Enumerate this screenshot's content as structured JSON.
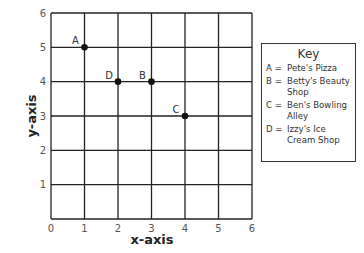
{
  "chart_data": {
    "type": "scatter",
    "title": "",
    "xlabel": "x-axis",
    "ylabel": "y-axis",
    "xlim": [
      0,
      6
    ],
    "ylim": [
      0,
      6
    ],
    "grid": true,
    "x_ticks": [
      "0",
      "1",
      "2",
      "3",
      "4",
      "5",
      "6"
    ],
    "y_ticks": [
      "0",
      "1",
      "2",
      "3",
      "4",
      "5",
      "6"
    ],
    "points": [
      {
        "label": "A",
        "x": 1,
        "y": 5,
        "name": "Pete's Pizza"
      },
      {
        "label": "B",
        "x": 3,
        "y": 4,
        "name": "Betty's Beauty Shop"
      },
      {
        "label": "C",
        "x": 4,
        "y": 3,
        "name": "Ben's Bowling Alley"
      },
      {
        "label": "D",
        "x": 2,
        "y": 4,
        "name": "Izzy's Ice Cream Shop"
      }
    ],
    "legend": {
      "title": "Key",
      "position": "right",
      "entries": [
        {
          "letter": "A =",
          "name": "Pete's Pizza"
        },
        {
          "letter": "B =",
          "name": "Betty's Beauty Shop"
        },
        {
          "letter": "C =",
          "name": "Ben's Bowling Alley"
        },
        {
          "letter": "D =",
          "name": "Izzy's Ice Cream Shop"
        }
      ]
    }
  }
}
